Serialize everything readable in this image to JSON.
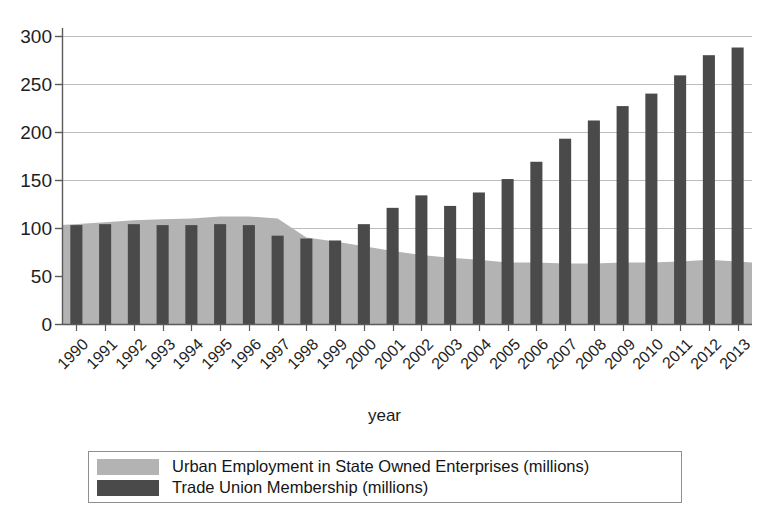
{
  "chart_data": {
    "type": "bar",
    "title": "",
    "xlabel": "year",
    "ylabel": "",
    "ylim": [
      0,
      300
    ],
    "yticks": [
      0,
      50,
      100,
      150,
      200,
      250,
      300
    ],
    "grid": true,
    "legend_position": "bottom",
    "categories": [
      "1990",
      "1991",
      "1992",
      "1993",
      "1994",
      "1995",
      "1996",
      "1997",
      "1998",
      "1999",
      "2000",
      "2001",
      "2002",
      "2003",
      "2004",
      "2005",
      "2006",
      "2007",
      "2008",
      "2009",
      "2010",
      "2011",
      "2012",
      "2013"
    ],
    "series": [
      {
        "name": "Urban Employment in State Owned Enterprises (millions)",
        "type": "area",
        "color": "#b3b3b3",
        "values": [
          103,
          106,
          108,
          109,
          110,
          112,
          112,
          110,
          90,
          86,
          81,
          76,
          72,
          69,
          67,
          64,
          64,
          63,
          63,
          64,
          64,
          65,
          67,
          64
        ]
      },
      {
        "name": "Trade Union Membership (millions)",
        "type": "bar",
        "color": "#4a4a4a",
        "values": [
          103,
          104,
          104,
          103,
          103,
          104,
          103,
          92,
          89,
          87,
          104,
          121,
          134,
          123,
          137,
          151,
          169,
          193,
          212,
          227,
          240,
          259,
          280,
          288
        ]
      }
    ]
  },
  "legend": {
    "items": [
      {
        "label": "Urban Employment in State Owned Enterprises (millions)",
        "color": "#b3b3b3"
      },
      {
        "label": "Trade Union Membership (millions)",
        "color": "#4a4a4a"
      }
    ]
  }
}
